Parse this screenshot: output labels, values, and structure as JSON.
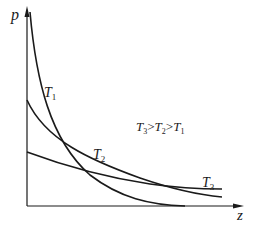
{
  "diagram": {
    "type": "isotherm-curves",
    "axes": {
      "y_label": "p",
      "x_label": "z"
    },
    "curves": [
      {
        "id": "T1",
        "label": "T",
        "subscript": "1"
      },
      {
        "id": "T2",
        "label": "T",
        "subscript": "2"
      },
      {
        "id": "T3",
        "label": "T",
        "subscript": "3"
      }
    ],
    "relation": {
      "parts": [
        {
          "label": "T",
          "subscript": "3"
        },
        {
          "op": ">"
        },
        {
          "label": "T",
          "subscript": "2"
        },
        {
          "op": ">"
        },
        {
          "label": "T",
          "subscript": "1"
        }
      ]
    },
    "colors": {
      "line": "#1a1a1a",
      "background": "#ffffff"
    }
  }
}
